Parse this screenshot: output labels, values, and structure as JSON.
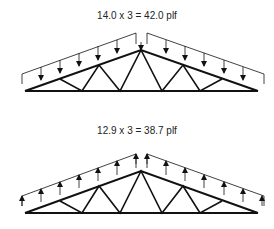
{
  "diagrams": [
    {
      "label": "14.0 x 3 = 42.0 plf",
      "load_direction": "down"
    },
    {
      "label": "12.9 x 3 = 38.7 plf",
      "load_direction": "up"
    }
  ]
}
